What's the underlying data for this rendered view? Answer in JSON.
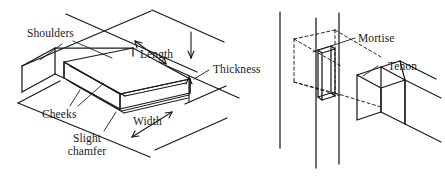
{
  "figure": {
    "background_color": "#ffffff",
    "line_color": "#1a1a1a",
    "text_color": "#1a1a1a",
    "width": 445,
    "height": 182
  },
  "left_diagram": {
    "name": "tenon-dimensions-diagram",
    "description": "Isometric view of a rail end cut to form a tenon, with dimension and part callouts",
    "labels": {
      "shoulders": "Shoulders",
      "length": "Length",
      "thickness": "Thickness",
      "cheeks": "Cheeks",
      "width": "Width",
      "slight_chamfer_line1": "Slight",
      "slight_chamfer_line2": "chamfer"
    }
  },
  "right_diagram": {
    "name": "mortise-and-tenon-joint-diagram",
    "description": "Isometric view of a stile with hidden mortise shown dashed and a mating tenon on a rail",
    "labels": {
      "mortise": "Mortise",
      "tenon": "Tenon"
    }
  }
}
